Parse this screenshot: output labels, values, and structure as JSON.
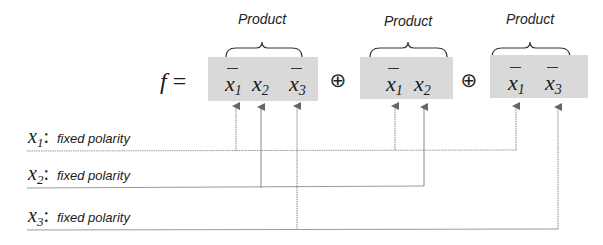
{
  "equation": {
    "lhs": "f",
    "equals": "=",
    "operator": "⊕",
    "terms": [
      {
        "label": "Product",
        "variables": [
          {
            "name": "x",
            "sub": "1",
            "complemented": true
          },
          {
            "name": "x",
            "sub": "2",
            "complemented": false
          },
          {
            "name": "x",
            "sub": "3",
            "complemented": true
          }
        ]
      },
      {
        "label": "Product",
        "variables": [
          {
            "name": "x",
            "sub": "1",
            "complemented": true
          },
          {
            "name": "x",
            "sub": "2",
            "complemented": false
          }
        ]
      },
      {
        "label": "Product",
        "variables": [
          {
            "name": "x",
            "sub": "1",
            "complemented": true
          },
          {
            "name": "x",
            "sub": "3",
            "complemented": true
          }
        ]
      }
    ]
  },
  "inputs": [
    {
      "name": "x",
      "sub": "1",
      "colon": ":",
      "description": "fixed polarity",
      "connects_to": [
        "term1.x1",
        "term2.x1",
        "term3.x1"
      ]
    },
    {
      "name": "x",
      "sub": "2",
      "colon": ":",
      "description": "fixed polarity",
      "connects_to": [
        "term1.x2",
        "term2.x2"
      ]
    },
    {
      "name": "x",
      "sub": "3",
      "colon": ":",
      "description": "fixed polarity",
      "connects_to": [
        "term1.x3",
        "term3.x3"
      ]
    }
  ],
  "colors": {
    "box_fill": "#d9d9d9",
    "line": "#888888",
    "text": "#1a1a1a"
  }
}
